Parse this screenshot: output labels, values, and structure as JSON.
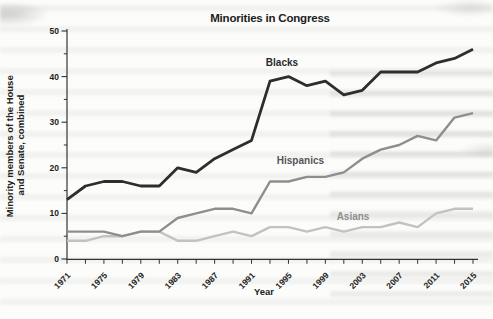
{
  "chart_data": {
    "type": "line",
    "title": "Minorities in Congress",
    "xlabel": "Year",
    "ylabel_line1": "Minority members of the House",
    "ylabel_line2": "and Senate, combined",
    "x": [
      1971,
      1973,
      1975,
      1977,
      1979,
      1981,
      1983,
      1985,
      1987,
      1989,
      1991,
      1993,
      1995,
      1997,
      1999,
      2001,
      2003,
      2005,
      2007,
      2009,
      2011,
      2013,
      2015
    ],
    "x_tick_labels": [
      "1971",
      "1975",
      "1979",
      "1983",
      "1987",
      "1991",
      "1995",
      "1999",
      "2003",
      "2007",
      "2011",
      "2015"
    ],
    "ylim": [
      0,
      50
    ],
    "y_major_ticks": [
      0,
      10,
      20,
      30,
      40,
      50
    ],
    "y_minor_ticks": [
      5,
      15,
      25,
      35,
      45
    ],
    "grid": "off",
    "legend": "inline-labels",
    "axis_color": "#333333",
    "series": [
      {
        "name": "Asians",
        "color": "#c2c2c2",
        "label_color": "#8f8f8f",
        "values": [
          4,
          4,
          5,
          5,
          6,
          6,
          4,
          4,
          5,
          6,
          5,
          7,
          7,
          6,
          7,
          6,
          7,
          7,
          8,
          7,
          10,
          11,
          11
        ],
        "label_pos": {
          "x": 2002.0,
          "y": 8.6
        }
      },
      {
        "name": "Hispanics",
        "color": "#8e8e8e",
        "label_color": "#555555",
        "values": [
          6,
          6,
          6,
          5,
          6,
          6,
          9,
          10,
          11,
          11,
          10,
          17,
          17,
          18,
          18,
          19,
          22,
          24,
          25,
          27,
          26,
          31,
          32
        ],
        "label_pos": {
          "x": 1996.3,
          "y": 20.8
        }
      },
      {
        "name": "Blacks",
        "color": "#2e2e2e",
        "label_color": "#2a2a2a",
        "values": [
          13,
          16,
          17,
          17,
          16,
          16,
          20,
          19,
          22,
          24,
          26,
          39,
          40,
          38,
          39,
          36,
          37,
          41,
          41,
          41,
          43,
          44,
          46
        ],
        "label_pos": {
          "x": 1994.3,
          "y": 42.4
        }
      }
    ]
  }
}
